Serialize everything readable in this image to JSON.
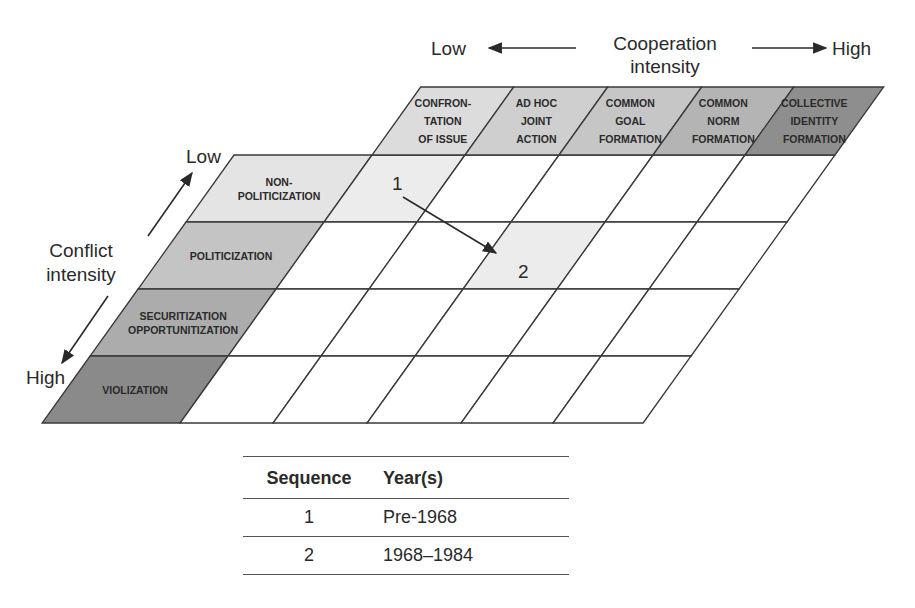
{
  "cooperation_axis": {
    "low_label": "Low",
    "title_line1": "Cooperation",
    "title_line2": "intensity",
    "high_label": "High"
  },
  "conflict_axis": {
    "low_label": "Low",
    "title_line1": "Conflict",
    "title_line2": "intensity",
    "high_label": "High"
  },
  "columns": [
    {
      "lines": [
        "CONFRON-",
        "TATION",
        "OF ISSUE"
      ],
      "color": "#dcdcdc"
    },
    {
      "lines": [
        "AD HOC",
        "JOINT",
        "ACTION"
      ],
      "color": "#cfcfcf"
    },
    {
      "lines": [
        "COMMON",
        "GOAL",
        "FORMATION"
      ],
      "color": "#c6c6c6"
    },
    {
      "lines": [
        "COMMON",
        "NORM",
        "FORMATION"
      ],
      "color": "#b4b4b4"
    },
    {
      "lines": [
        "COLLECTIVE",
        "IDENTITY",
        "FORMATION"
      ],
      "color": "#8e8e8e"
    }
  ],
  "rows": [
    {
      "lines": [
        "NON-",
        "POLITICIZATION"
      ],
      "color": "#e4e4e4"
    },
    {
      "lines": [
        "POLITICIZATION"
      ],
      "color": "#c4c4c4"
    },
    {
      "lines": [
        "SECURITIZATION",
        "OPPORTUNITIZATION"
      ],
      "color": "#acacac"
    },
    {
      "lines": [
        "VIOLIZATION"
      ],
      "color": "#8a8a8a"
    }
  ],
  "highlighted_cells": [
    {
      "row": 0,
      "col": 0,
      "color": "#ececec"
    },
    {
      "row": 1,
      "col": 2,
      "color": "#ececec"
    }
  ],
  "trajectory": {
    "points": [
      {
        "label": "1",
        "row": 0,
        "col": 0
      },
      {
        "label": "2",
        "row": 1,
        "col": 2
      }
    ]
  },
  "table": {
    "headers": [
      "Sequence",
      "Year(s)"
    ],
    "rows": [
      {
        "sequence": "1",
        "years": "Pre-1968"
      },
      {
        "sequence": "2",
        "years": "1968–1984"
      }
    ]
  }
}
